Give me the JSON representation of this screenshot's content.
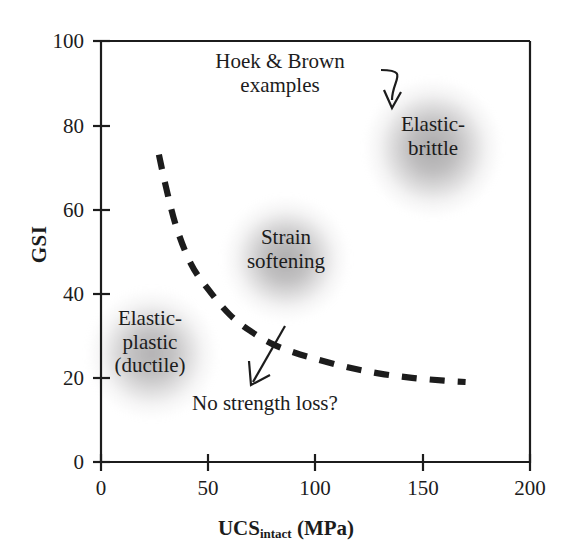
{
  "chart_data": {
    "type": "line",
    "title": "",
    "xlabel": "UCS_intact (MPa)",
    "ylabel": "GSI",
    "xlim": [
      0,
      200
    ],
    "ylim": [
      0,
      100
    ],
    "xticks": [
      0,
      50,
      100,
      150,
      200
    ],
    "yticks": [
      0,
      20,
      40,
      60,
      80,
      100
    ],
    "grid": false,
    "legend": "none",
    "series": [
      {
        "name": "behaviour boundary",
        "style": "dashed",
        "color": "#1c1c1c",
        "x": [
          27,
          30,
          35,
          42,
          50,
          60,
          70,
          80,
          90,
          100,
          115,
          130,
          145,
          160,
          170
        ],
        "y": [
          73,
          66,
          56,
          47,
          41,
          35,
          31,
          28,
          26,
          24.5,
          22.5,
          21,
          20,
          19.3,
          19
        ]
      }
    ],
    "regions": [
      {
        "name": "Elastic-brittle",
        "label": "Elastic-\nbrittle",
        "x": 150,
        "y": 77
      },
      {
        "name": "Strain softening",
        "label": "Strain\nsoftening",
        "x": 88,
        "y": 52
      },
      {
        "name": "Elastic-plastic ductile",
        "label": "Elastic-\nplastic\n(ductile)",
        "x": 22,
        "y": 31
      }
    ],
    "annotations": [
      {
        "name": "hoek-brown-examples",
        "text": "Hoek & Brown\nexamples",
        "arrow": "curved-to-elastic-brittle"
      },
      {
        "name": "no-strength-loss",
        "text": "No strength loss?",
        "arrow": "straight-down-left"
      }
    ]
  },
  "axes": {
    "y_label": "GSI",
    "x_label_main": "UCS",
    "x_label_sub": "intact",
    "x_label_unit": " (MPa)",
    "y_ticks": [
      "0",
      "20",
      "40",
      "60",
      "80",
      "100"
    ],
    "x_ticks": [
      "0",
      "50",
      "100",
      "150",
      "200"
    ]
  },
  "labels": {
    "hoek_brown": "Hoek & Brown\nexamples",
    "elastic_brittle": "Elastic-\nbrittle",
    "strain_softening": "Strain\nsoftening",
    "elastic_plastic": "Elastic-\nplastic\n(ductile)",
    "no_strength_loss": "No strength loss?"
  },
  "colors": {
    "axis": "#1c1c1c",
    "curve": "#1c1c1c",
    "text": "#1c1c1c",
    "blob": "#8c8a8c",
    "background": "#ffffff"
  }
}
